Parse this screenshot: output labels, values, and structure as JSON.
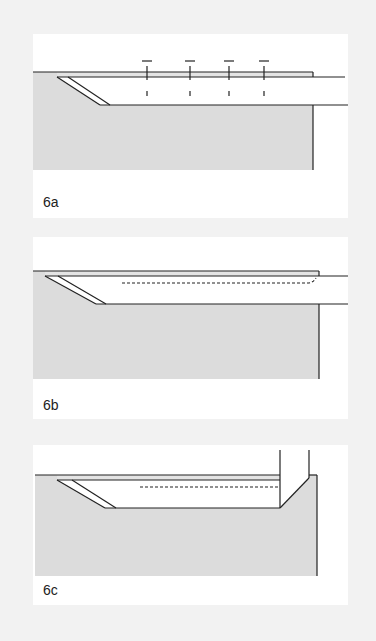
{
  "colors": {
    "background": "#f2f2f2",
    "panel": "#ffffff",
    "material": "#dcdcdc",
    "strip": "#e4e4e4",
    "line": "#222222"
  },
  "panels": [
    {
      "id": "6a",
      "label": "6a",
      "description": "Veneer strip over beveled groove with four vertical pins/nails and alignment dashes"
    },
    {
      "id": "6b",
      "label": "6b",
      "description": "Veneer strip over beveled groove with dashed hidden line curling up at the end"
    },
    {
      "id": "6c",
      "label": "6c",
      "description": "Beveled groove with dashed hidden line and vertical chamfer tool/insert at right end"
    }
  ]
}
